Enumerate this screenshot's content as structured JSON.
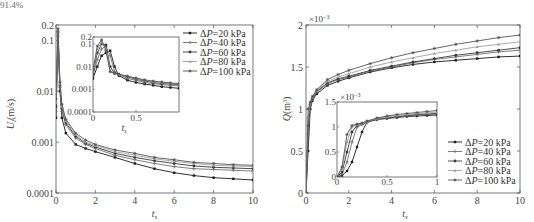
{
  "caption_fragment": "91.4%",
  "chart_data": [
    {
      "type": "line",
      "title": "",
      "xlabel": "t_s",
      "ylabel": "U_l (m/s)",
      "yscale": "log",
      "xlim": [
        0,
        10
      ],
      "ylim": [
        0.0001,
        0.2
      ],
      "xticks": [
        "0",
        "2",
        "4",
        "6",
        "8",
        "10"
      ],
      "yticks": [
        "0.0001",
        "0.001",
        "0.01",
        "0.1",
        "0.2"
      ],
      "legend_position": "upper right (outside inset)",
      "x": [
        0,
        0.1,
        0.2,
        0.3,
        0.5,
        1,
        1.5,
        2,
        3,
        4,
        5,
        6,
        7,
        8,
        9,
        10
      ],
      "series": [
        {
          "name": "ΔP=20 kPa",
          "values": [
            0.003,
            0.12,
            0.01,
            0.003,
            0.0015,
            0.0009,
            0.00075,
            0.00065,
            0.0005,
            0.00038,
            0.0003,
            0.00025,
            0.00022,
            0.0002,
            0.00019,
            0.00018
          ]
        },
        {
          "name": "ΔP=40 kPa",
          "values": [
            0.004,
            0.14,
            0.012,
            0.004,
            0.0022,
            0.0012,
            0.0009,
            0.00075,
            0.00055,
            0.00045,
            0.00038,
            0.00033,
            0.0003,
            0.00029,
            0.00028,
            0.00027
          ]
        },
        {
          "name": "ΔP=60 kPa",
          "values": [
            0.005,
            0.15,
            0.013,
            0.0045,
            0.0024,
            0.0013,
            0.00095,
            0.0008,
            0.0006,
            0.0005,
            0.00043,
            0.00038,
            0.00034,
            0.00032,
            0.00031,
            0.0003
          ]
        },
        {
          "name": "ΔP=80 kPa",
          "values": [
            0.006,
            0.16,
            0.014,
            0.005,
            0.0026,
            0.0014,
            0.001,
            0.00085,
            0.00065,
            0.00055,
            0.00047,
            0.00042,
            0.00038,
            0.00035,
            0.00034,
            0.00033
          ]
        },
        {
          "name": "ΔP=100 kPa",
          "values": [
            0.007,
            0.17,
            0.015,
            0.0055,
            0.0028,
            0.0015,
            0.0011,
            0.0009,
            0.0007,
            0.0006,
            0.0005,
            0.00045,
            0.0004,
            0.00038,
            0.00036,
            0.00035
          ]
        }
      ],
      "inset": {
        "xlim": [
          0,
          1
        ],
        "ylim": [
          0.0001,
          0.2
        ],
        "xticks": [
          "0",
          "0.5"
        ],
        "yticks": [
          "0.0001",
          "0.001",
          "0.01",
          "0.1",
          "0.2"
        ],
        "xlabel": "t_s",
        "x": [
          0,
          0.05,
          0.1,
          0.15,
          0.2,
          0.25,
          0.3,
          0.4,
          0.5,
          0.6,
          0.7,
          0.8,
          0.9,
          1.0
        ],
        "series": [
          {
            "name": "ΔP=20 kPa",
            "values": [
              0.003,
              0.01,
              0.03,
              0.04,
              0.05,
              0.01,
              0.004,
              0.0025,
              0.002,
              0.0017,
              0.0015,
              0.0013,
              0.0012,
              0.0011
            ]
          },
          {
            "name": "ΔP=40 kPa",
            "values": [
              0.004,
              0.02,
              0.06,
              0.08,
              0.03,
              0.006,
              0.0045,
              0.003,
              0.0025,
              0.002,
              0.0018,
              0.0016,
              0.0015,
              0.0014
            ]
          },
          {
            "name": "ΔP=60 kPa",
            "values": [
              0.005,
              0.04,
              0.1,
              0.09,
              0.01,
              0.005,
              0.0045,
              0.0035,
              0.0028,
              0.0023,
              0.002,
              0.0018,
              0.0017,
              0.0016
            ]
          },
          {
            "name": "ΔP=80 kPa",
            "values": [
              0.006,
              0.06,
              0.12,
              0.06,
              0.006,
              0.005,
              0.0045,
              0.0037,
              0.003,
              0.0025,
              0.0022,
              0.002,
              0.0018,
              0.0017
            ]
          },
          {
            "name": "ΔP=100 kPa",
            "values": [
              0.007,
              0.08,
              0.15,
              0.05,
              0.006,
              0.005,
              0.0046,
              0.0038,
              0.0031,
              0.0026,
              0.0023,
              0.0021,
              0.0019,
              0.0018
            ]
          }
        ]
      }
    },
    {
      "type": "line",
      "title": "",
      "xlabel": "t_s",
      "ylabel": "Q (m^3)",
      "yscale": "linear",
      "y_multiplier": "×10^-3",
      "xlim": [
        0,
        10
      ],
      "ylim": [
        0,
        2
      ],
      "xticks": [
        "0",
        "2",
        "4",
        "6",
        "8",
        "10"
      ],
      "yticks": [
        "0",
        "0.5",
        "1",
        "1.5",
        "2"
      ],
      "legend_position": "lower right",
      "x": [
        0,
        0.1,
        0.2,
        0.3,
        0.5,
        1,
        1.5,
        2,
        3,
        4,
        5,
        6,
        7,
        8,
        9,
        10
      ],
      "series": [
        {
          "name": "ΔP=20 kPa",
          "values": [
            0,
            0.5,
            1.0,
            1.1,
            1.18,
            1.28,
            1.33,
            1.37,
            1.44,
            1.49,
            1.53,
            1.56,
            1.58,
            1.6,
            1.62,
            1.63
          ]
        },
        {
          "name": "ΔP=40 kPa",
          "values": [
            0,
            0.7,
            1.05,
            1.12,
            1.2,
            1.3,
            1.35,
            1.38,
            1.45,
            1.5,
            1.55,
            1.59,
            1.62,
            1.65,
            1.68,
            1.7
          ]
        },
        {
          "name": "ΔP=60 kPa",
          "values": [
            0,
            0.8,
            1.06,
            1.13,
            1.21,
            1.31,
            1.36,
            1.39,
            1.46,
            1.51,
            1.56,
            1.6,
            1.64,
            1.67,
            1.7,
            1.73
          ]
        },
        {
          "name": "ΔP=80 kPa",
          "values": [
            0,
            0.9,
            1.07,
            1.14,
            1.22,
            1.33,
            1.38,
            1.42,
            1.5,
            1.56,
            1.61,
            1.66,
            1.7,
            1.74,
            1.77,
            1.8
          ]
        },
        {
          "name": "ΔP=100 kPa",
          "values": [
            0,
            1.0,
            1.08,
            1.15,
            1.23,
            1.35,
            1.41,
            1.46,
            1.54,
            1.61,
            1.67,
            1.72,
            1.77,
            1.81,
            1.85,
            1.88
          ]
        }
      ],
      "inset": {
        "xlim": [
          0,
          1
        ],
        "ylim": [
          0,
          1.5
        ],
        "y_multiplier": "×10^-3",
        "xticks": [
          "0",
          "0.5",
          "1"
        ],
        "yticks": [
          "0",
          "0.5",
          "1",
          "1.5"
        ],
        "x": [
          0,
          0.05,
          0.1,
          0.15,
          0.2,
          0.25,
          0.3,
          0.4,
          0.5,
          0.6,
          0.7,
          0.8,
          0.9,
          1.0
        ],
        "series": [
          {
            "name": "ΔP=20 kPa",
            "values": [
              0,
              0.03,
              0.12,
              0.3,
              0.6,
              0.9,
              1.1,
              1.15,
              1.17,
              1.19,
              1.21,
              1.22,
              1.23,
              1.24
            ]
          },
          {
            "name": "ΔP=40 kPa",
            "values": [
              0,
              0.06,
              0.3,
              0.7,
              1.0,
              1.05,
              1.1,
              1.15,
              1.18,
              1.2,
              1.22,
              1.24,
              1.25,
              1.26
            ]
          },
          {
            "name": "ΔP=60 kPa",
            "values": [
              0,
              0.1,
              0.5,
              0.9,
              1.03,
              1.06,
              1.1,
              1.16,
              1.19,
              1.21,
              1.23,
              1.25,
              1.26,
              1.27
            ]
          },
          {
            "name": "ΔP=80 kPa",
            "values": [
              0,
              0.15,
              0.7,
              1.0,
              1.05,
              1.07,
              1.11,
              1.17,
              1.2,
              1.23,
              1.25,
              1.27,
              1.28,
              1.3
            ]
          },
          {
            "name": "ΔP=100 kPa",
            "values": [
              0,
              0.2,
              0.85,
              1.03,
              1.06,
              1.08,
              1.12,
              1.18,
              1.22,
              1.25,
              1.27,
              1.29,
              1.31,
              1.33
            ]
          }
        ]
      }
    }
  ],
  "legend": {
    "entries": [
      "ΔP=20 kPa",
      "ΔP=40 kPa",
      "ΔP=60 kPa",
      "ΔP=80 kPa",
      "ΔP=100 kPa"
    ],
    "colors": [
      "#1a1a1a",
      "#707070",
      "#3a3a3a",
      "#a0a0a0",
      "#555555"
    ]
  }
}
